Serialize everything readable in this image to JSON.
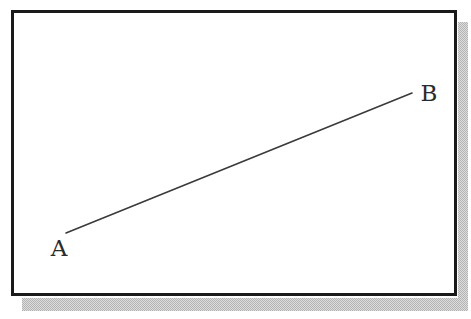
{
  "figure": {
    "title": "",
    "background_color": "#ffffff",
    "frame": {
      "border_color": "#1a1a1a",
      "border_width_px": 3,
      "fill_color": "#ffffff",
      "x": 11,
      "y": 10,
      "width": 446,
      "height": 286
    },
    "shadow": {
      "color": "#b4b4b4",
      "style": "dithered-checker",
      "offset_x_px": 11,
      "offset_y_px": 11
    }
  },
  "labels": {
    "a": "A",
    "b": "B"
  },
  "chart_data": {
    "type": "line",
    "title": "",
    "xlabel": "",
    "ylabel": "",
    "grid": false,
    "legend": "none",
    "axes_visible": false,
    "xlim": [
      11,
      457
    ],
    "ylim": [
      296,
      10
    ],
    "annotations": [
      {
        "text": "A",
        "x": 59,
        "y": 256,
        "anchor": "below-left-of-point"
      },
      {
        "text": "B",
        "x": 429,
        "y": 101,
        "anchor": "right-of-point"
      }
    ],
    "series": [
      {
        "name": "segment-AB",
        "color": "#3a3a3a",
        "line_width_px": 1.6,
        "points": [
          {
            "label": "A",
            "x": 66,
            "y": 233
          },
          {
            "label": "B",
            "x": 412,
            "y": 93
          }
        ],
        "x": [
          66,
          412
        ],
        "values": [
          233,
          93
        ]
      }
    ]
  }
}
